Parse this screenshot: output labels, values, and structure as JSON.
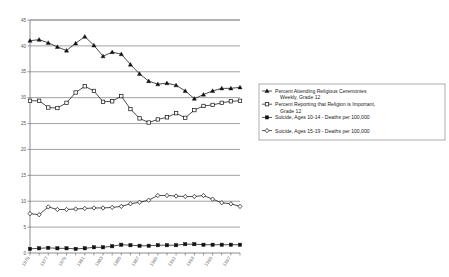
{
  "chart_data": {
    "type": "line",
    "title": "",
    "xlabel": "",
    "ylabel": "",
    "ylim": [
      0,
      45
    ],
    "yticks": [
      0,
      5,
      10,
      15,
      20,
      25,
      30,
      35,
      40,
      45
    ],
    "grid": true,
    "legend_position": "right",
    "x": [
      1975,
      1976,
      1977,
      1978,
      1979,
      1980,
      1981,
      1982,
      1983,
      1984,
      1985,
      1986,
      1987,
      1988,
      1989,
      1990,
      1991,
      1992,
      1993,
      1994,
      1995,
      1996,
      1997,
      1998
    ],
    "xtick_labels": [
      "1975",
      "1977",
      "1979",
      "1981",
      "1983",
      "1985",
      "1987",
      "1989",
      "1991",
      "1993",
      "1995",
      "1997"
    ],
    "series": [
      {
        "name": "Percent Attending Religious Ceremonies Weekly, Grade 12",
        "marker": "triangle",
        "values": [
          41.0,
          41.2,
          40.6,
          39.8,
          39.1,
          40.5,
          41.8,
          40.1,
          38.0,
          38.8,
          38.4,
          36.4,
          34.6,
          33.2,
          32.6,
          32.8,
          32.4,
          31.3,
          29.8,
          30.6,
          31.3,
          31.8,
          31.8,
          32.0
        ]
      },
      {
        "name": "Percent Reporting that Religion is Important, Grade 12",
        "marker": "square-open",
        "values": [
          29.4,
          29.4,
          28.1,
          28.0,
          29.0,
          31.0,
          32.2,
          31.3,
          29.2,
          29.3,
          30.3,
          27.8,
          26.0,
          25.2,
          25.8,
          26.2,
          27.0,
          26.1,
          27.6,
          28.4,
          28.6,
          29.0,
          29.3,
          29.4
        ]
      },
      {
        "name": "Suicide, Ages 10-14 - Deaths per 100,000",
        "marker": "square-filled",
        "values": [
          0.8,
          0.9,
          1.0,
          0.9,
          0.9,
          0.8,
          0.9,
          1.1,
          1.1,
          1.3,
          1.6,
          1.5,
          1.4,
          1.4,
          1.5,
          1.5,
          1.5,
          1.7,
          1.7,
          1.6,
          1.6,
          1.6,
          1.6,
          1.6
        ]
      },
      {
        "name": "Suicide, Ages 15-19 - Deaths per 100,000",
        "marker": "diamond-open",
        "values": [
          7.6,
          7.4,
          8.9,
          8.4,
          8.4,
          8.5,
          8.6,
          8.7,
          8.7,
          8.8,
          9.0,
          9.5,
          9.8,
          10.2,
          11.1,
          11.1,
          11.0,
          10.9,
          10.9,
          11.1,
          10.4,
          9.7,
          9.5,
          9.0
        ]
      }
    ]
  },
  "legend": {
    "items": [
      {
        "label_line1": "Percent Attending Religious Ceremonies",
        "label_line2": "Weekly, Grade 12",
        "marker": "triangle"
      },
      {
        "label_line1": "Percent Reporting that Religion is Important,",
        "label_line2": "Grade 12",
        "marker": "square-open"
      },
      {
        "label_line1": "Suicide, Ages 10-14 - Deaths per 100,000",
        "label_line2": "",
        "marker": "square-filled"
      },
      {
        "label_line1": "Suicide, Ages 15-19 - Deaths per 100,000",
        "label_line2": "",
        "marker": "diamond-open"
      }
    ]
  },
  "colors": {
    "line": "#111111",
    "grid": "#7a7a7a",
    "frame": "#6e6e6e",
    "text": "#555555",
    "background": "#ffffff"
  }
}
